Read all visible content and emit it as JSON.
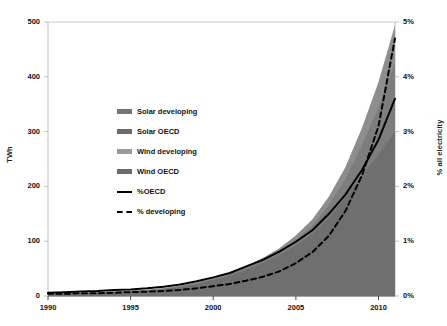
{
  "chart_data": {
    "type": "area",
    "title": "",
    "subtitle": "",
    "xlabel": "",
    "ylabel": "TWh",
    "y2label": "% all electricity",
    "xlim": [
      1990,
      2011
    ],
    "ylim": [
      0,
      500
    ],
    "y2lim": [
      0,
      5
    ],
    "grid": false,
    "legend_position": "inside-left",
    "x_tick_labels": [
      "1990",
      "1995",
      "2000",
      "2005",
      "2010"
    ],
    "x_ticks": [
      1990,
      1995,
      2000,
      2005,
      2010
    ],
    "y_tick_labels": [
      "0",
      "100",
      "200",
      "300",
      "400",
      "500"
    ],
    "y_ticks": [
      0,
      100,
      200,
      300,
      400,
      500
    ],
    "y2_tick_labels": [
      "0%",
      "1%",
      "2%",
      "3%",
      "4%",
      "5%"
    ],
    "y2_ticks": [
      0,
      1,
      2,
      3,
      4,
      5
    ],
    "x": [
      1990,
      1991,
      1992,
      1993,
      1994,
      1995,
      1996,
      1997,
      1998,
      1999,
      2000,
      2001,
      2002,
      2003,
      2004,
      2005,
      2006,
      2007,
      2008,
      2009,
      2010,
      2011
    ],
    "series": [
      {
        "name": "Wind OECD",
        "axis": "left",
        "stack": 1,
        "color": "#6b6b6b",
        "values": [
          3.5,
          4.2,
          5.0,
          6.0,
          7.4,
          8.6,
          10.0,
          12.5,
          16.5,
          21.5,
          29.0,
          36.5,
          48.0,
          60.0,
          74.0,
          92.0,
          113.0,
          143.0,
          180.0,
          220.0,
          258.0,
          300.0
        ]
      },
      {
        "name": "Wind developing",
        "axis": "left",
        "stack": 2,
        "color": "#8f8f8f",
        "values": [
          0.1,
          0.1,
          0.2,
          0.3,
          0.4,
          0.5,
          0.7,
          0.9,
          1.2,
          1.6,
          2.2,
          2.8,
          3.6,
          5.0,
          7.0,
          10.0,
          15.0,
          23.0,
          34.0,
          55.0,
          85.0,
          125.0
        ]
      },
      {
        "name": "Solar OECD",
        "axis": "left",
        "stack": 3,
        "color": "#6b6b6b",
        "values": [
          0.3,
          0.3,
          0.4,
          0.4,
          0.5,
          0.6,
          0.7,
          0.9,
          1.1,
          1.4,
          1.8,
          2.3,
          3.0,
          4.0,
          5.5,
          8.0,
          11.0,
          14.5,
          20.0,
          30.0,
          45.0,
          65.0
        ]
      },
      {
        "name": "Solar developing",
        "axis": "left",
        "stack": 4,
        "color": "#757575",
        "values": [
          0.0,
          0.0,
          0.0,
          0.0,
          0.0,
          0.0,
          0.0,
          0.0,
          0.1,
          0.1,
          0.1,
          0.1,
          0.2,
          0.2,
          0.3,
          0.4,
          0.5,
          0.7,
          1.0,
          1.5,
          2.5,
          5.0
        ]
      },
      {
        "name": "%OECD",
        "axis": "right",
        "style": "solid",
        "color": "#000000",
        "values": [
          0.06,
          0.07,
          0.08,
          0.09,
          0.11,
          0.12,
          0.14,
          0.17,
          0.21,
          0.27,
          0.34,
          0.42,
          0.54,
          0.66,
          0.81,
          0.99,
          1.2,
          1.5,
          1.85,
          2.3,
          2.85,
          3.6
        ]
      },
      {
        "name": "% developing",
        "axis": "right",
        "style": "dashed",
        "color": "#000000",
        "values": [
          0.04,
          0.04,
          0.05,
          0.05,
          0.06,
          0.07,
          0.08,
          0.09,
          0.11,
          0.14,
          0.18,
          0.22,
          0.28,
          0.35,
          0.45,
          0.6,
          0.8,
          1.1,
          1.55,
          2.2,
          3.1,
          4.7
        ]
      }
    ],
    "legend": [
      {
        "label": "Solar developing",
        "marker": "swatch",
        "color": "#757575"
      },
      {
        "label": "Solar OECD",
        "marker": "swatch",
        "color": "#6b6b6b"
      },
      {
        "label": "Wind developing",
        "marker": "swatch",
        "color": "#9a9a9a"
      },
      {
        "label": "Wind OECD",
        "marker": "swatch",
        "color": "#6b6b6b"
      },
      {
        "label": "%OECD",
        "marker": "solid-line",
        "color": "#000000"
      },
      {
        "label": "% developing",
        "marker": "dashed-line",
        "color": "#000000"
      }
    ]
  },
  "colors": {
    "area_dark": "#6f6f6f",
    "area_light": "#9b9b9b",
    "line": "#000000",
    "axis": "#bfbfbf",
    "text": "#111111",
    "background": "#ffffff"
  }
}
